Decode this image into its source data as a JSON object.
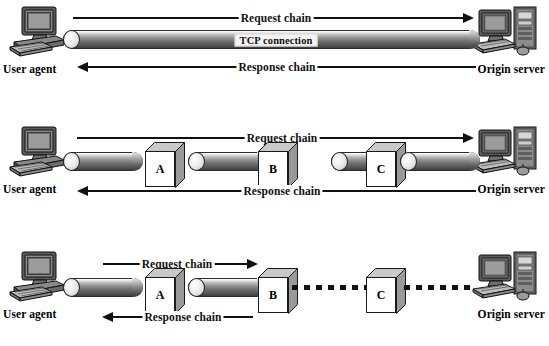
{
  "diagram": {
    "rows": [
      {
        "id": "row-direct",
        "name": "direct-connection-row",
        "left_device": {
          "icon": "workstation-icon",
          "label": "User agent"
        },
        "right_device": {
          "icon": "server-icon",
          "label": "Origin server"
        },
        "request_label": "Request chain",
        "response_label": "Response chain",
        "connection_label": "TCP connection",
        "intermediaries": []
      },
      {
        "id": "row-proxies",
        "name": "proxy-chain-row",
        "left_device": {
          "icon": "workstation-icon",
          "label": "User agent"
        },
        "right_device": {
          "icon": "server-icon",
          "label": "Origin server"
        },
        "request_label": "Request chain",
        "response_label": "Response chain",
        "intermediaries": [
          {
            "label": "A"
          },
          {
            "label": "B"
          },
          {
            "label": "C"
          }
        ]
      },
      {
        "id": "row-partial",
        "name": "partial-chain-row",
        "left_device": {
          "icon": "workstation-icon",
          "label": "User agent"
        },
        "right_device": {
          "icon": "server-icon",
          "label": "Origin server"
        },
        "request_label": "Request chain",
        "response_label": "Response chain",
        "intermediaries": [
          {
            "label": "A"
          },
          {
            "label": "B"
          },
          {
            "label": "C"
          }
        ]
      }
    ],
    "colors": {
      "ink": "#111111",
      "background": "#ffffff",
      "cylinder_dark": "#3d3d3d",
      "cylinder_light": "#ffffff",
      "cube_face": "#ffffff",
      "cube_shade": "#9a9a9a"
    }
  }
}
